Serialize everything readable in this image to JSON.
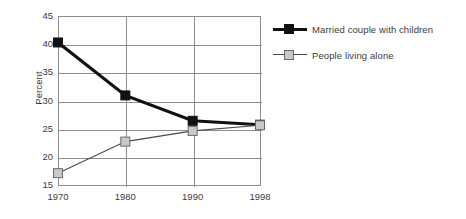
{
  "chart_data": {
    "type": "line",
    "title": "",
    "subtitle": "",
    "xlabel": "",
    "ylabel": "Percent",
    "categories": [
      "1970",
      "1980",
      "1990",
      "1998"
    ],
    "x_tick_labels": [
      "1970",
      "1980",
      "1990",
      "1998"
    ],
    "y_tick_labels": [
      "15",
      "20",
      "25",
      "30",
      "35",
      "40",
      "45"
    ],
    "ylim": [
      15,
      45
    ],
    "ytick_step": 5,
    "grid": "horizontal-and-vertical",
    "legend_position": "right",
    "series": [
      {
        "name": "Married couple with children",
        "values": [
          40.3,
          30.9,
          26.4,
          25.7
        ],
        "color": "#111111",
        "marker": "filled-square"
      },
      {
        "name": "People living alone",
        "values": [
          17.1,
          22.7,
          24.6,
          25.6
        ],
        "color": "#c9c9c9",
        "marker": "open-square"
      }
    ]
  },
  "legend": {
    "items": [
      {
        "label": "Married couple with children",
        "swatch": "dark-square-marker"
      },
      {
        "label": "People living alone",
        "swatch": "light-square-marker"
      }
    ]
  },
  "axes": {
    "y_axis_title": "Percent"
  }
}
